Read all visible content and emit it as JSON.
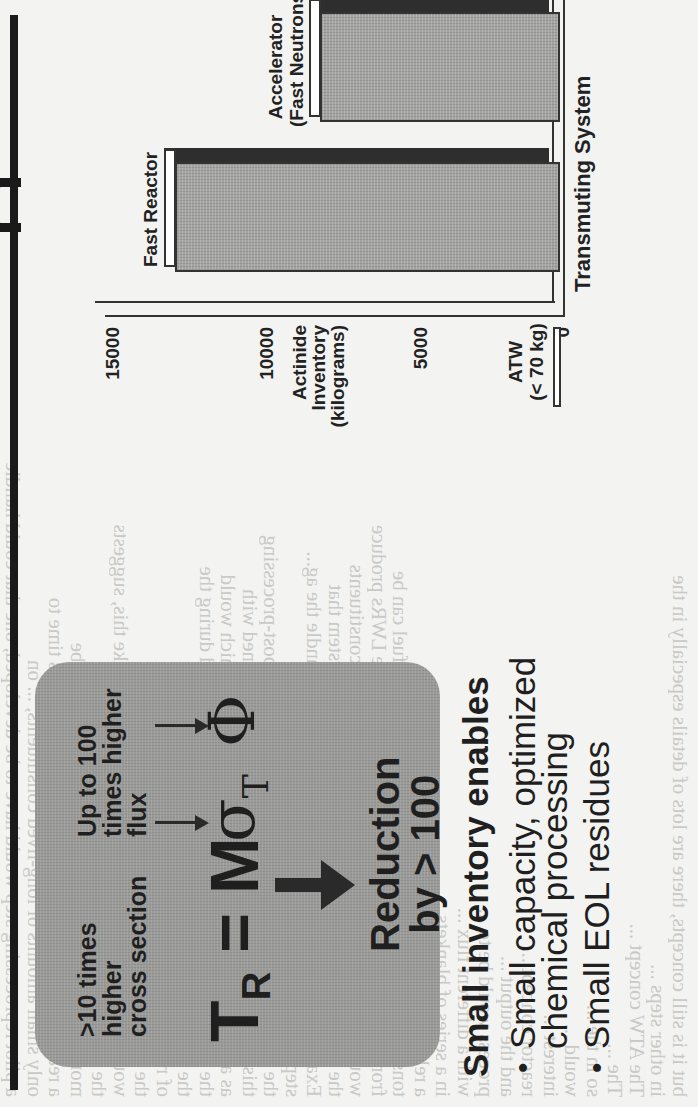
{
  "page": {
    "bleed_through_lines": [
      "a pilot reprocessing step would have to be developed, one that could handle",
      "only small amounts of long-lived constituents, ... on",
      "a reactor. A substantial amount of less than 10 years time to",
      "monitored storage ... program if this process would be",
      "the activity ... and disposal. The current technology",
      "would require significant chemistry, or something like this, suggests",
      "the cost of ... concepts. One line",
      "of reasoning ... demonstrated to",
      "the effective ... environmental",
      "the in-core fission, stable products that are produced during the",
      "as also clean out are the short-lived components, which would",
      "this disposal type of concept, one is not only concerned with",
      "the transmutation, but also with how upstream and post-processing",
      "steps would occur.",
      "Examining conceptually how a system that could handle the ag...",
      "the continental reserve. It's possible to envision a system that",
      "would do all important long-lived high-level waste constituents",
      "from 1000 MWe light water reactors (LWRs). Those LWRs produce",
      "tons of spent fuel for reprocessing. From that spent fuel can be",
      "a relatively wide distribution...",
      "in a series of blankets ...",
      "with a different flux ...",
      "process would be to ...",
      "and the output ...",
      "reactor concept ...",
      "interest ...",
      "would ...",
      "so in the ...",
      "The ...",
      "The ATW concept ...",
      "in other steps ...",
      "but it is still concepts, there are lots of details especially in the"
    ]
  },
  "slide": {
    "formula_box": {
      "left_note": ">10 times\nhigher\ncross section",
      "right_note": "Up to 100\ntimes higher\nflux",
      "formula_T": "T",
      "formula_T_sub": "R",
      "formula_eq": "=",
      "formula_M": "M",
      "formula_sigma": "σ",
      "formula_sigma_sub": "T",
      "formula_phi": "Φ",
      "reduction_note": "Reduction\nby > 100"
    },
    "bullets": {
      "heading": "Small inventory enables",
      "items": [
        "Small capacity, optimized chemical processing",
        "Small EOL residues"
      ],
      "bullet_glyph": "•"
    }
  },
  "chart_data": {
    "type": "bar",
    "orientation": "vertical 3D bars (page rotated 90° counter-clockwise)",
    "title": "",
    "categories": [
      "Fast Reactor",
      "Accelerator (Fast Neutrons)",
      "ATW (< 70 kg)"
    ],
    "values": [
      12500,
      7800,
      70
    ],
    "value_notes": {
      "ATW": "< 70 kg"
    },
    "xlabel": "Transmuting System",
    "ylabel": "Actinide Inventory (kilograms)",
    "yticks": [
      0,
      5000,
      10000,
      15000
    ],
    "ylim": [
      0,
      15000
    ],
    "grid": false,
    "legend": null,
    "colors": {
      "bar_front": "#a3a3a1",
      "bar_side": "#2e2e2e",
      "axis": "#333333"
    }
  },
  "chart_labels": {
    "y_axis_title_1": "Actinide",
    "y_axis_title_2": "Inventory",
    "y_axis_title_3": "(kilograms)",
    "tick_0": "0",
    "tick_5000": "5000",
    "tick_10000": "10000",
    "tick_15000": "15000",
    "bar_fast_reactor": "Fast Reactor",
    "bar_accelerator_1": "Accelerator",
    "bar_accelerator_2": "(Fast Neutrons)",
    "bar_atw_1": "ATW",
    "bar_atw_2": "(< 70 kg)",
    "x_axis_title": "Transmuting System"
  }
}
